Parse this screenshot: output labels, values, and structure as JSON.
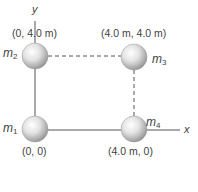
{
  "diagram": {
    "axes": {
      "x_label": "x",
      "y_label": "y"
    },
    "masses": [
      {
        "id": "m1",
        "symbol": "m",
        "subscript": "1",
        "coord_label": "(0, 0)"
      },
      {
        "id": "m2",
        "symbol": "m",
        "subscript": "2",
        "coord_label": "(0, 4.0 m)"
      },
      {
        "id": "m3",
        "symbol": "m",
        "subscript": "3",
        "coord_label": "(4.0 m, 4.0 m)"
      },
      {
        "id": "m4",
        "symbol": "m",
        "subscript": "4",
        "coord_label": "(4.0 m, 0)"
      }
    ],
    "colors": {
      "line": "#555555",
      "dashed": "#555555",
      "sphere_light": "#ffffff",
      "sphere_dark": "#8f8f8f"
    }
  }
}
